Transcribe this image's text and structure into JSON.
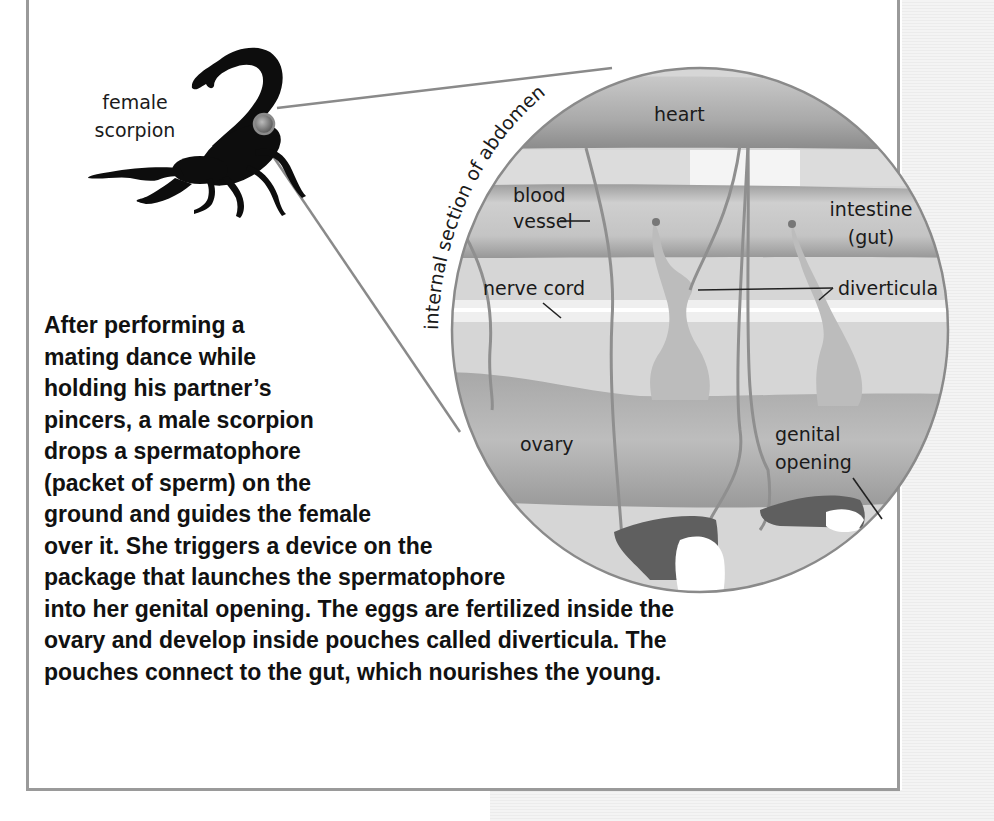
{
  "figure": {
    "scorpion_label": [
      "female",
      "scorpion"
    ],
    "curved_title": "internal section of abdomen",
    "labels": {
      "heart": "heart",
      "blood_vessel": [
        "blood",
        "vessel"
      ],
      "intestine": [
        "intestine",
        "(gut)"
      ],
      "nerve_cord": "nerve cord",
      "diverticula": "diverticula",
      "ovary": "ovary",
      "genital_opening": [
        "genital",
        "opening"
      ]
    },
    "colors": {
      "panel_border": "#9a9a9a",
      "tissue_light": "#d9d9d9",
      "tissue_mid": "#b5b5b5",
      "tissue_dark": "#8f8f8f",
      "scorpion": "#0d0d0d"
    }
  },
  "caption": {
    "lines": [
      "After performing a",
      "mating dance while",
      "holding his partner’s",
      "pincers, a male scorpion",
      "drops a spermatophore",
      "(packet of sperm) on the",
      "ground and guides the female",
      "over it. She triggers a device on the",
      "package that launches the spermatophore",
      "into her genital opening. The eggs are fertilized inside the",
      "ovary and develop inside pouches called diverticula. The",
      "pouches connect to the gut, which nourishes the young."
    ]
  }
}
